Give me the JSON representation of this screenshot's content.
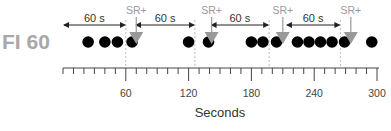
{
  "figure": {
    "schedule_label": "FI 60",
    "axis_title": "Seconds",
    "interval_label": "60 s",
    "reinforcer_label": "SR+",
    "colors": {
      "dot": "#000000",
      "reinforcer": "#999999",
      "axis": "#444444",
      "dashed_line": "#bbbbbb",
      "schedule_label": "#a8a8a8"
    }
  },
  "axis": {
    "min": 0,
    "max": 300,
    "major_ticks": [
      60,
      120,
      180,
      240,
      300
    ],
    "major_tick_labels": [
      "60",
      "120",
      "180",
      "240",
      "300"
    ],
    "minor_tick_step": 10
  },
  "intervals": [
    {
      "start": 0,
      "end": 60,
      "label": "60 s"
    },
    {
      "start": 69,
      "end": 126,
      "label": "60 s"
    },
    {
      "start": 141,
      "end": 197,
      "label": "60 s"
    },
    {
      "start": 213,
      "end": 265,
      "label": "60 s"
    }
  ],
  "reinforcers": [
    {
      "time": 70,
      "label": "SR+"
    },
    {
      "time": 142,
      "label": "SR+"
    },
    {
      "time": 210,
      "label": "SR+"
    },
    {
      "time": 275,
      "label": "SR+"
    }
  ],
  "responses": [
    24,
    40,
    52,
    66,
    120,
    139,
    180,
    191,
    204,
    224,
    235,
    246,
    257,
    269,
    295
  ],
  "chart_data": {
    "type": "scatter",
    "title": "FI 60",
    "xlabel": "Seconds",
    "ylabel": "",
    "xlim": [
      0,
      300
    ],
    "x_ticks": [
      60,
      120,
      180,
      240,
      300
    ],
    "series": [
      {
        "name": "Responses",
        "x": [
          24,
          40,
          52,
          66,
          120,
          139,
          180,
          191,
          204,
          224,
          235,
          246,
          257,
          269,
          295
        ]
      },
      {
        "name": "SR+ (reinforcer)",
        "x": [
          70,
          142,
          210,
          275
        ]
      }
    ],
    "annotations": [
      "60 s",
      "60 s",
      "60 s",
      "60 s",
      "SR+",
      "SR+",
      "SR+",
      "SR+"
    ]
  }
}
